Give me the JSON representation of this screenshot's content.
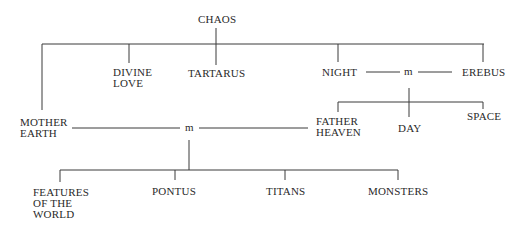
{
  "diagram": {
    "type": "genealogy-tree",
    "nodes": {
      "chaos": {
        "lines": [
          "CHAOS"
        ]
      },
      "divine_love": {
        "lines": [
          "DIVINE",
          "LOVE"
        ]
      },
      "tartarus": {
        "lines": [
          "TARTARUS"
        ]
      },
      "night": {
        "lines": [
          "NIGHT"
        ]
      },
      "erebus": {
        "lines": [
          "EREBUS"
        ]
      },
      "mother_earth": {
        "lines": [
          "MOTHER",
          "EARTH"
        ]
      },
      "father_heaven": {
        "lines": [
          "FATHER",
          "HEAVEN"
        ]
      },
      "day": {
        "lines": [
          "DAY"
        ]
      },
      "space": {
        "lines": [
          "SPACE"
        ]
      },
      "features_of_the_world": {
        "lines": [
          "FEATURES",
          "OF THE",
          "WORLD"
        ]
      },
      "pontus": {
        "lines": [
          "PONTUS"
        ]
      },
      "titans": {
        "lines": [
          "TITANS"
        ]
      },
      "monsters": {
        "lines": [
          "MONSTERS"
        ]
      }
    },
    "marriages": {
      "night_erebus": {
        "label": "m",
        "partners": [
          "NIGHT",
          "EREBUS"
        ],
        "children": [
          "FATHER HEAVEN",
          "DAY",
          "SPACE"
        ]
      },
      "earth_heaven": {
        "label": "m",
        "partners": [
          "MOTHER EARTH",
          "FATHER HEAVEN"
        ],
        "children": [
          "FEATURES OF THE WORLD",
          "PONTUS",
          "TITANS",
          "MONSTERS"
        ]
      }
    },
    "edges": [
      {
        "parent": "CHAOS",
        "children": [
          "MOTHER EARTH",
          "DIVINE LOVE",
          "TARTARUS",
          "NIGHT",
          "EREBUS"
        ]
      }
    ]
  }
}
